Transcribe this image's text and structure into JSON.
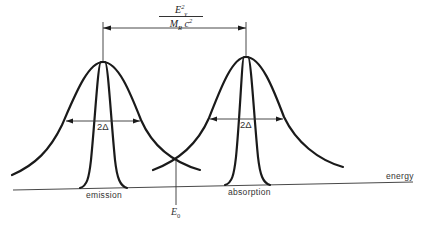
{
  "diagram": {
    "type": "spectral-line-shift",
    "shift_label": {
      "numerator": "E",
      "numerator_sub": "γ",
      "numerator_sup": "2",
      "denominator_mass": "M",
      "denominator_sub": "R",
      "denominator_c": "c",
      "denominator_sup": "2"
    },
    "width_labels": [
      "2Δ",
      "2Δ"
    ],
    "line_labels": {
      "emission": "emission",
      "absorption": "absorption"
    },
    "axis_label": "energy",
    "center_label": "E",
    "center_sub": "0",
    "curves": [
      {
        "name": "emission-broad",
        "peak_x": 103,
        "peak_y": 62
      },
      {
        "name": "emission-narrow",
        "peak_x": 103,
        "peak_y": 62
      },
      {
        "name": "absorption-broad",
        "peak_x": 246,
        "peak_y": 57
      },
      {
        "name": "absorption-narrow",
        "peak_x": 246,
        "peak_y": 57
      }
    ],
    "colors": {
      "ink": "#1a1a1a",
      "background": "#ffffff"
    }
  }
}
